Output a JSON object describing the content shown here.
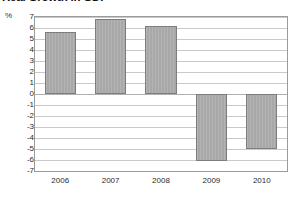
{
  "chart_data": {
    "type": "bar",
    "title": "Real Growth in GDP",
    "xlabel": "",
    "ylabel": "%",
    "categories": [
      "2006",
      "2007",
      "2008",
      "2009",
      "2010"
    ],
    "values": [
      5.6,
      6.8,
      6.2,
      -6.1,
      -5.0
    ],
    "ylim": [
      -7,
      7
    ],
    "ytick_labels": [
      "7",
      "6",
      "5",
      "4",
      "3",
      "2",
      "1",
      "0",
      "-1",
      "-2",
      "-3",
      "-4",
      "-5",
      "-6",
      "-7"
    ],
    "ytick_values": [
      7,
      6,
      5,
      4,
      3,
      2,
      1,
      0,
      -1,
      -2,
      -3,
      -4,
      -5,
      -6,
      -7
    ],
    "grid": true,
    "legend": false,
    "bar_color": "#a8a8a8",
    "bar_border_color": "#7d7d7d",
    "frame_color": "#9b9b9b",
    "gridline_color": "#c9c9c9"
  }
}
